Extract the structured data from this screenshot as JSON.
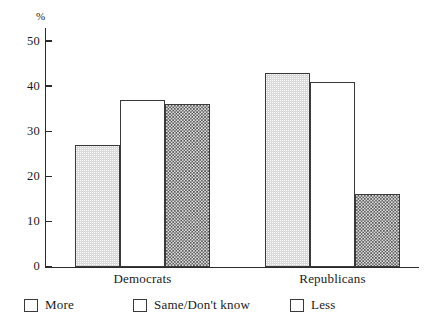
{
  "chart_data": {
    "type": "bar",
    "title": "",
    "subtitle": "",
    "xlabel": "",
    "ylabel": "%",
    "ylim": [
      0,
      52
    ],
    "yticks": [
      0,
      10,
      20,
      30,
      40,
      50
    ],
    "ytick_labels": [
      "0",
      "10",
      "20",
      "30",
      "40",
      "50"
    ],
    "grid": false,
    "legend_position": "bottom",
    "categories": [
      "Democrats",
      "Republicans"
    ],
    "series": [
      {
        "name": "More",
        "fill": "light-gray-stipple",
        "values": [
          27,
          43
        ]
      },
      {
        "name": "Same/Don't know",
        "fill": "white",
        "values": [
          37,
          41
        ]
      },
      {
        "name": "Less",
        "fill": "dark-checker",
        "values": [
          36,
          16
        ]
      }
    ],
    "colors": {
      "more": "#d9d9d9",
      "same": "#ffffff",
      "less": "#4d4d4d",
      "axis": "#2b2b2b",
      "bar_outline": "#3a3a3a",
      "background": "#ffffff"
    }
  },
  "axis": {
    "unit_label": "%"
  }
}
